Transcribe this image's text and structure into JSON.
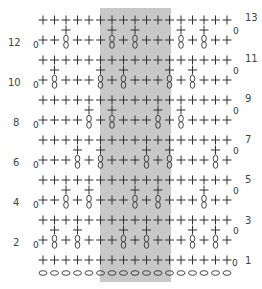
{
  "chart_data": {
    "type": "crochet-chart",
    "title": "",
    "columns": 17,
    "legend": {
      "+": "single crochet",
      "T": "tall stitch (cross over double oval)",
      "o": "chain",
      "0": "turning chain"
    },
    "shaded_repeat": {
      "from_col": 5,
      "to_col": 11,
      "color": "#c8c8c8"
    },
    "row_labels_left": [
      "12",
      "10",
      "8",
      "6",
      "4",
      "2"
    ],
    "row_labels_right": [
      "13",
      "11",
      "9",
      "7",
      "5",
      "3",
      "1"
    ],
    "rows": [
      {
        "row": 13,
        "stitches": "+++++++++++++++++"
      },
      {
        "row": 12,
        "stitches": "++T+++T+T+++T+T++"
      },
      {
        "row": 11,
        "stitches": "+++++++++++++++++"
      },
      {
        "row": 10,
        "stitches": "+T+++T+T+++T+T+++"
      },
      {
        "row": 9,
        "stitches": "+++++++++++++++++"
      },
      {
        "row": 8,
        "stitches": "++++T+T+++T+T++++"
      },
      {
        "row": 7,
        "stitches": "+++++++++++++++++"
      },
      {
        "row": 6,
        "stitches": "+++T+T+++T+T+++T+"
      },
      {
        "row": 5,
        "stitches": "+++++++++++++++++"
      },
      {
        "row": 4,
        "stitches": "++T+T+++T+T+++T++"
      },
      {
        "row": 3,
        "stitches": "+++++++++++++++++"
      },
      {
        "row": 2,
        "stitches": "+T+T+++T+T+++T+T+"
      },
      {
        "row": 1,
        "stitches": "+++++++++++++++++"
      }
    ],
    "foundation_chain": 17,
    "colors": {
      "stitch": "#333333",
      "shade": "#c8c8c8",
      "label": "#444444"
    }
  }
}
